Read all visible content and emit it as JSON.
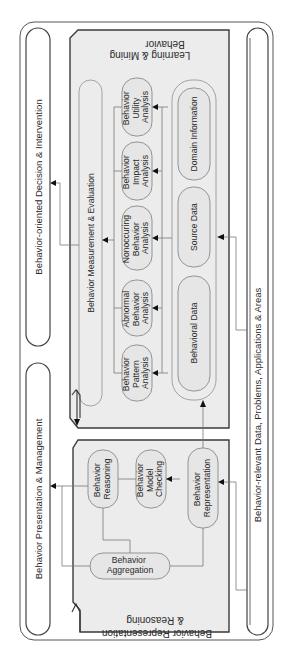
{
  "diagram": {
    "orientation": "rotated-ccw-90",
    "colors": {
      "panel_fill": "#ececec",
      "node_fill": "#e6e6e6",
      "frame_stroke": "#555555",
      "arrow": "#111111"
    },
    "outer_layers": {
      "decision": "Behavior-oriented Decision & Intervention",
      "presentation": "Behavior Presentation & Management",
      "data": "Behavior-relevant Data, Problems, Applications & Areas"
    },
    "learning_panel": {
      "title_line1": "Behavior",
      "title_line2": "Learning & Mining",
      "measurement_bar": "Behavior Measurement & Evaluation",
      "analyses": [
        {
          "line1": "Behavior",
          "line2": "Pattern",
          "line3": "Analysis"
        },
        {
          "line1": "Abnormal",
          "line2": "Behavior",
          "line3": "Analysis"
        },
        {
          "line1": "Nonoccuring",
          "line2": "Behavior",
          "line3": "Analysis"
        },
        {
          "line1": "Behavior",
          "line2": "Impact",
          "line3": "Analysis"
        },
        {
          "line1": "Behavior",
          "line2": "Utility",
          "line3": "Analysis"
        }
      ],
      "data_sources": [
        {
          "label": "Behavioral Data"
        },
        {
          "label": "Source Data"
        },
        {
          "label": "Domain Information"
        }
      ]
    },
    "reasoning_panel": {
      "title_line1": "Behavior Representation",
      "title_line2": "& Reasoning",
      "nodes": {
        "reasoning": {
          "line1": "Behavior",
          "line2": "Reasoning"
        },
        "model_checking": {
          "line1": "Behavior",
          "line2": "Model",
          "line3": "Checking"
        },
        "representation": {
          "line1": "Behavior",
          "line2": "Representation"
        },
        "aggregation": {
          "line1": "Behavior",
          "line2": "Aggregation"
        }
      }
    }
  }
}
